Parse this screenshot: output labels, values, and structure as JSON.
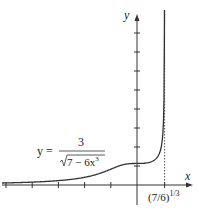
{
  "chart_data": {
    "type": "line",
    "title": "",
    "xlabel": "x",
    "ylabel": "y",
    "series": [
      {
        "name": "y = 3/sqrt(7 - 6x^3)",
        "formula": "3/sqrt(7-6*x^3)",
        "x": [
          -5,
          -4,
          -3,
          -2,
          -1,
          -0.5,
          0,
          0.5,
          0.8,
          0.95,
          1.0,
          1.03,
          1.045,
          1.05
        ],
        "values": [
          0.109,
          0.152,
          0.232,
          0.4,
          0.822,
          1.08,
          1.134,
          1.199,
          1.535,
          2.43,
          3.0,
          4.54,
          8.1,
          16.0
        ]
      }
    ],
    "asymptote": {
      "x_label": "(7/6)",
      "x_label_exp": "1/3",
      "x_value": 1.0527,
      "style": "dashed"
    },
    "x_ticks": [
      -5,
      -4,
      -3,
      -2,
      -1,
      0,
      1.0527
    ],
    "y_ticks": [
      1,
      2,
      3,
      4,
      5,
      6,
      7,
      8
    ],
    "xlim": [
      -5.2,
      1.4
    ],
    "ylim": [
      -1.6,
      9
    ],
    "grid": false,
    "annotation": {
      "lhs": "y =",
      "numerator": "3",
      "radicand": "7 − 6x",
      "exponent": "3"
    }
  }
}
